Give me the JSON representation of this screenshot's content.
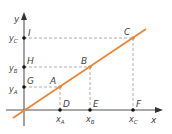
{
  "colors": {
    "axis": "#555555",
    "line": "#e8873a",
    "dash": "#999999",
    "point": "#111111",
    "label": "#444444"
  },
  "axes": {
    "x_label": "x",
    "y_label": "y"
  },
  "points": {
    "A": {
      "label": "A",
      "x": 60,
      "y": 87
    },
    "B": {
      "label": "B",
      "x": 90,
      "y": 67
    },
    "C": {
      "label": "C",
      "x": 133,
      "y": 38
    },
    "D": {
      "label": "D",
      "x": 60,
      "y": 110
    },
    "E": {
      "label": "E",
      "x": 90,
      "y": 110
    },
    "F": {
      "label": "F",
      "x": 133,
      "y": 110
    },
    "G": {
      "label": "G",
      "x": 24,
      "y": 87
    },
    "H": {
      "label": "H",
      "x": 24,
      "y": 67
    },
    "I": {
      "label": "I",
      "x": 24,
      "y": 38
    }
  },
  "tick_labels": {
    "xA": {
      "main": "x",
      "sub": "A"
    },
    "xB": {
      "main": "x",
      "sub": "B"
    },
    "xC": {
      "main": "x",
      "sub": "C"
    },
    "yA": {
      "main": "y",
      "sub": "A"
    },
    "yB": {
      "main": "y",
      "sub": "B"
    },
    "yC": {
      "main": "y",
      "sub": "C"
    }
  }
}
